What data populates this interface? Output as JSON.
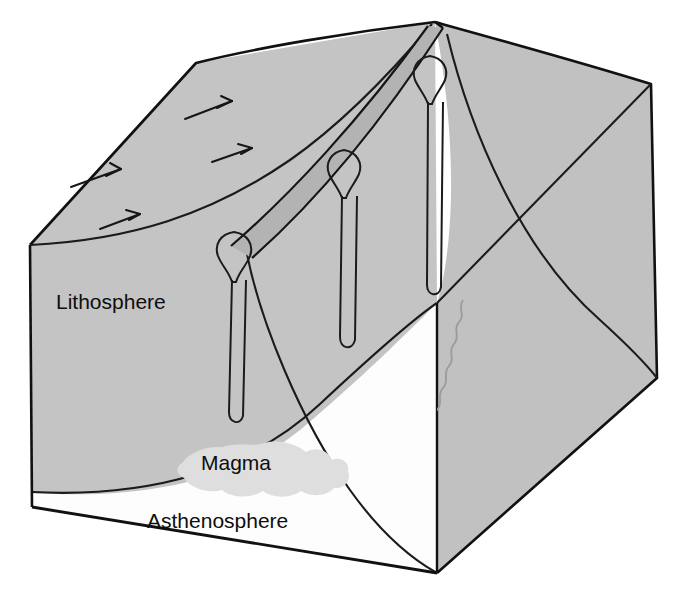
{
  "figure": {
    "type": "geological-block-diagram",
    "background_color": "#ffffff"
  },
  "colors": {
    "lithosphere_fill": "#c4c4c4",
    "lithosphere_top_fill": "#c9c9c9",
    "lithosphere_right_fill": "#c1c1c1",
    "rift_band_fill": "#b3b3b3",
    "asthenosphere_fill": "#fdfdfd",
    "magma_fill": "#dedede",
    "outline_stroke": "#111111",
    "thin_stroke": "#222222",
    "label_text": "#0e0e0e"
  },
  "labels": [
    {
      "id": "lithosphere",
      "text": "Lithosphere",
      "x": 56,
      "y": 309,
      "font_size": 21
    },
    {
      "id": "magma",
      "text": "Magma",
      "x": 201,
      "y": 470,
      "font_size": 21
    },
    {
      "id": "asthenosphere",
      "text": "Asthenosphere",
      "x": 147,
      "y": 528,
      "font_size": 21
    }
  ],
  "features": {
    "conduit_count": 3,
    "conduits": [
      {
        "id": "conduit-front",
        "bulb_cx": 234,
        "bulb_cy": 249,
        "stem_bottom_y": 425
      },
      {
        "id": "conduit-middle",
        "bulb_cx": 344,
        "bulb_cy": 166,
        "stem_bottom_y": 350
      },
      {
        "id": "conduit-back",
        "bulb_cx": 430,
        "bulb_cy": 72,
        "stem_bottom_y": 296
      }
    ],
    "rift_band": {
      "id": "rift-band",
      "description": "shaded rift valley band running from front-left-down to back-right-up"
    },
    "spreading_arrows": [
      {
        "id": "arrow-lower-left",
        "direction": "up-right"
      },
      {
        "id": "arrow-lower-right",
        "direction": "down-left"
      },
      {
        "id": "arrow-upper-left",
        "direction": "up-right"
      },
      {
        "id": "arrow-upper-right",
        "direction": "down-left"
      }
    ],
    "boundaries": [
      {
        "id": "lithosphere-asthenosphere-boundary-front",
        "style": "smooth-curve"
      },
      {
        "id": "lithosphere-asthenosphere-boundary-right",
        "style": "smooth-curve"
      },
      {
        "id": "fracture-wiggly-line",
        "style": "wiggly-line"
      }
    ]
  },
  "geometry": {
    "front_top_left": [
      30,
      245
    ],
    "front_bottom_left": [
      32,
      507
    ],
    "front_apex_top": [
      196,
      63
    ],
    "ridge_apex": [
      435,
      22
    ],
    "front_bottom_right": [
      437,
      573
    ],
    "right_mid": [
      657,
      378
    ],
    "right_top": [
      651,
      84
    ],
    "inner_corner": [
      437,
      303
    ]
  }
}
